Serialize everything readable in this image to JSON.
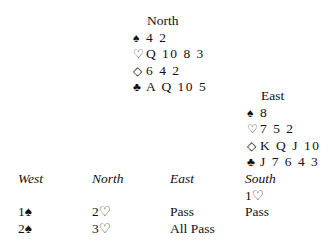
{
  "north": {
    "label": "North",
    "spades": {
      "symbol": "♠",
      "cards": "4 2"
    },
    "hearts": {
      "symbol": "♡",
      "cards": "Q 10 8 3"
    },
    "diamonds": {
      "symbol": "◇",
      "cards": "6 4 2"
    },
    "clubs": {
      "symbol": "♣",
      "cards": "A Q 10 5"
    }
  },
  "east": {
    "label": "East",
    "spades": {
      "symbol": "♠",
      "cards": "8"
    },
    "hearts": {
      "symbol": "♡",
      "cards": "7 5 2"
    },
    "diamonds": {
      "symbol": "◇",
      "cards": "K Q J 10"
    },
    "clubs": {
      "symbol": "♣",
      "cards": "J 7 6 4 3"
    }
  },
  "auction": {
    "headers": [
      "West",
      "North",
      "East",
      "South"
    ],
    "rows": [
      [
        "",
        "",
        "",
        "1♡"
      ],
      [
        "1♠",
        "2♡",
        "Pass",
        "Pass"
      ],
      [
        "2♠",
        "3♡",
        "All Pass",
        ""
      ]
    ]
  }
}
